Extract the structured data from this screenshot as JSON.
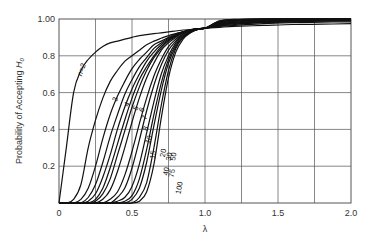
{
  "chart_data": {
    "type": "line",
    "title": "",
    "xlabel": "λ",
    "ylabel": "Probability of Accepting H0",
    "ylabel_main": "Probability of Accepting ",
    "ylabel_italic": "H",
    "ylabel_sub": "0",
    "xlim": [
      0,
      2.0
    ],
    "ylim": [
      0,
      1.0
    ],
    "x_ticks": [
      0,
      0.5,
      1.0,
      1.5,
      2.0
    ],
    "x_tick_labels": [
      "0",
      "0.5",
      "1.0",
      "1.5",
      "2.0"
    ],
    "y_ticks": [
      0,
      0.2,
      0.4,
      0.6,
      0.8,
      1.0
    ],
    "y_tick_labels": [
      "0",
      "0.2",
      "0.4",
      "0.6",
      "0.8",
      "1.00"
    ],
    "grid": true,
    "x_grid_step": 0.25,
    "y_grid_step": 0.2,
    "legend": "inline curve labels",
    "x": [
      0.0,
      0.05,
      0.1,
      0.15,
      0.2,
      0.25,
      0.3,
      0.35,
      0.4,
      0.45,
      0.5,
      0.55,
      0.6,
      0.65,
      0.7,
      0.75,
      0.8,
      0.85,
      0.9,
      0.95,
      1.0,
      1.1,
      1.2,
      1.4,
      1.6,
      1.8,
      2.0
    ],
    "series": [
      {
        "name": "n=2",
        "values": [
          0.0,
          0.3,
          0.6,
          0.72,
          0.78,
          0.82,
          0.85,
          0.87,
          0.88,
          0.89,
          0.9,
          0.91,
          0.915,
          0.92,
          0.925,
          0.93,
          0.935,
          0.94,
          0.943,
          0.947,
          0.95,
          0.955,
          0.96,
          0.965,
          0.97,
          0.972,
          0.975
        ]
      },
      {
        "name": "3",
        "values": [
          0.0,
          0.0,
          0.02,
          0.1,
          0.3,
          0.45,
          0.57,
          0.66,
          0.72,
          0.77,
          0.8,
          0.83,
          0.86,
          0.88,
          0.895,
          0.91,
          0.92,
          0.93,
          0.94,
          0.945,
          0.95,
          0.96,
          0.965,
          0.975,
          0.98,
          0.983,
          0.985
        ]
      },
      {
        "name": "4",
        "values": [
          0.0,
          0.0,
          0.0,
          0.02,
          0.08,
          0.2,
          0.35,
          0.48,
          0.58,
          0.66,
          0.73,
          0.78,
          0.82,
          0.86,
          0.88,
          0.9,
          0.92,
          0.93,
          0.94,
          0.945,
          0.95,
          0.962,
          0.97,
          0.98,
          0.985,
          0.988,
          0.99
        ]
      },
      {
        "name": "5",
        "values": [
          0.0,
          0.0,
          0.0,
          0.0,
          0.03,
          0.1,
          0.22,
          0.36,
          0.48,
          0.59,
          0.67,
          0.74,
          0.79,
          0.84,
          0.87,
          0.895,
          0.915,
          0.93,
          0.94,
          0.946,
          0.95,
          0.965,
          0.973,
          0.983,
          0.988,
          0.99,
          0.992
        ]
      },
      {
        "name": "6",
        "values": [
          0.0,
          0.0,
          0.0,
          0.0,
          0.01,
          0.05,
          0.14,
          0.26,
          0.4,
          0.52,
          0.62,
          0.7,
          0.77,
          0.82,
          0.86,
          0.89,
          0.91,
          0.93,
          0.94,
          0.946,
          0.95,
          0.967,
          0.976,
          0.986,
          0.99,
          0.992,
          0.994
        ]
      },
      {
        "name": "7",
        "values": [
          0.0,
          0.0,
          0.0,
          0.0,
          0.0,
          0.02,
          0.08,
          0.19,
          0.32,
          0.45,
          0.57,
          0.67,
          0.74,
          0.8,
          0.85,
          0.885,
          0.91,
          0.93,
          0.94,
          0.946,
          0.95,
          0.968,
          0.978,
          0.988,
          0.992,
          0.994,
          0.996
        ]
      },
      {
        "name": "8",
        "values": [
          0.0,
          0.0,
          0.0,
          0.0,
          0.0,
          0.01,
          0.05,
          0.13,
          0.26,
          0.39,
          0.52,
          0.63,
          0.72,
          0.79,
          0.84,
          0.88,
          0.905,
          0.925,
          0.94,
          0.946,
          0.95,
          0.97,
          0.98,
          0.99,
          0.994,
          0.996,
          0.997
        ]
      },
      {
        "name": "10",
        "values": [
          0.0,
          0.0,
          0.0,
          0.0,
          0.0,
          0.0,
          0.02,
          0.07,
          0.17,
          0.3,
          0.44,
          0.57,
          0.68,
          0.76,
          0.83,
          0.87,
          0.9,
          0.925,
          0.94,
          0.946,
          0.95,
          0.972,
          0.983,
          0.992,
          0.996,
          0.998,
          0.998
        ]
      },
      {
        "name": "15",
        "values": [
          0.0,
          0.0,
          0.0,
          0.0,
          0.0,
          0.0,
          0.0,
          0.02,
          0.06,
          0.15,
          0.28,
          0.43,
          0.57,
          0.69,
          0.78,
          0.85,
          0.89,
          0.92,
          0.935,
          0.945,
          0.95,
          0.975,
          0.987,
          0.995,
          0.998,
          0.999,
          0.999
        ]
      },
      {
        "name": "20",
        "values": [
          0.0,
          0.0,
          0.0,
          0.0,
          0.0,
          0.0,
          0.0,
          0.0,
          0.03,
          0.08,
          0.19,
          0.34,
          0.5,
          0.64,
          0.75,
          0.83,
          0.88,
          0.915,
          0.935,
          0.945,
          0.95,
          0.978,
          0.99,
          0.997,
          0.999,
          1.0,
          1.0
        ]
      },
      {
        "name": "30",
        "values": [
          0.0,
          0.0,
          0.0,
          0.0,
          0.0,
          0.0,
          0.0,
          0.0,
          0.01,
          0.03,
          0.09,
          0.21,
          0.38,
          0.55,
          0.7,
          0.8,
          0.87,
          0.91,
          0.93,
          0.944,
          0.95,
          0.98,
          0.992,
          0.998,
          1.0,
          1.0,
          1.0
        ]
      },
      {
        "name": "40",
        "values": [
          0.0,
          0.0,
          0.0,
          0.0,
          0.0,
          0.0,
          0.0,
          0.0,
          0.0,
          0.01,
          0.04,
          0.13,
          0.29,
          0.48,
          0.65,
          0.78,
          0.86,
          0.905,
          0.93,
          0.944,
          0.95,
          0.983,
          0.994,
          0.999,
          1.0,
          1.0,
          1.0
        ]
      },
      {
        "name": "50",
        "values": [
          0.0,
          0.0,
          0.0,
          0.0,
          0.0,
          0.0,
          0.0,
          0.0,
          0.0,
          0.0,
          0.02,
          0.08,
          0.22,
          0.42,
          0.61,
          0.76,
          0.85,
          0.9,
          0.93,
          0.944,
          0.95,
          0.985,
          0.995,
          0.999,
          1.0,
          1.0,
          1.0
        ]
      },
      {
        "name": "75",
        "values": [
          0.0,
          0.0,
          0.0,
          0.0,
          0.0,
          0.0,
          0.0,
          0.0,
          0.0,
          0.0,
          0.0,
          0.03,
          0.11,
          0.3,
          0.53,
          0.72,
          0.84,
          0.9,
          0.925,
          0.943,
          0.95,
          0.988,
          0.997,
          1.0,
          1.0,
          1.0,
          1.0
        ]
      },
      {
        "name": "100",
        "values": [
          0.0,
          0.0,
          0.0,
          0.0,
          0.0,
          0.0,
          0.0,
          0.0,
          0.0,
          0.0,
          0.0,
          0.01,
          0.06,
          0.21,
          0.46,
          0.68,
          0.82,
          0.89,
          0.925,
          0.943,
          0.95,
          0.99,
          0.998,
          1.0,
          1.0,
          1.0,
          1.0
        ]
      }
    ],
    "curve_labels": [
      {
        "text": "n=2",
        "x": 0.17,
        "y": 0.72,
        "rot": -70
      },
      {
        "text": "3",
        "x": 0.4,
        "y": 0.56,
        "rot": -70
      },
      {
        "text": "4",
        "x": 0.48,
        "y": 0.53,
        "rot": -60
      },
      {
        "text": "5",
        "x": 0.54,
        "y": 0.51,
        "rot": -60
      },
      {
        "text": "6",
        "x": 0.58,
        "y": 0.5,
        "rot": -60
      },
      {
        "text": "7",
        "x": 0.6,
        "y": 0.46,
        "rot": -70
      },
      {
        "text": "8",
        "x": 0.61,
        "y": 0.4,
        "rot": -70
      },
      {
        "text": "10",
        "x": 0.63,
        "y": 0.34,
        "rot": -70
      },
      {
        "text": "15",
        "x": 0.66,
        "y": 0.26,
        "rot": -80
      },
      {
        "text": "20",
        "x": 0.73,
        "y": 0.27,
        "rot": -80
      },
      {
        "text": "30",
        "x": 0.77,
        "y": 0.25,
        "rot": -80
      },
      {
        "text": "50",
        "x": 0.8,
        "y": 0.25,
        "rot": -80
      },
      {
        "text": "40",
        "x": 0.75,
        "y": 0.17,
        "rot": -80
      },
      {
        "text": "75",
        "x": 0.79,
        "y": 0.16,
        "rot": -80
      },
      {
        "text": "100",
        "x": 0.84,
        "y": 0.08,
        "rot": -80
      }
    ]
  },
  "colors": {
    "curve": "#111111",
    "grid": "#555555",
    "text": "#333333",
    "background": "#ffffff"
  }
}
